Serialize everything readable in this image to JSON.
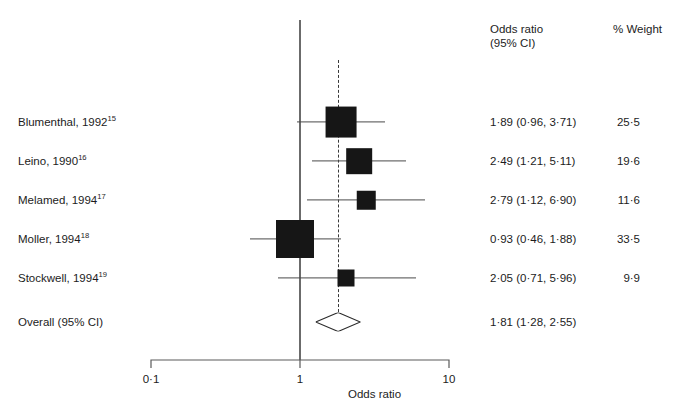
{
  "figure": {
    "headers": {
      "or_line1": "Odds ratio",
      "or_line2": "(95% CI)",
      "weight": "% Weight"
    },
    "axis": {
      "title": "Odds ratio",
      "ticks": [
        "0·1",
        "1",
        "10"
      ],
      "tick_values": [
        0.1,
        1,
        10
      ],
      "scale": "log",
      "null_value": 1
    },
    "overall": {
      "label": "Overall (95% CI)",
      "or_text": "1·81 (1·28, 2·55)",
      "weight_text": ""
    }
  },
  "chart_data": {
    "type": "forest",
    "title": "",
    "xlabel": "Odds ratio",
    "ylabel": "",
    "xscale": "log",
    "xlim": [
      0.1,
      10
    ],
    "xticks": [
      0.1,
      1,
      10
    ],
    "xticklabels": [
      "0·1",
      "1",
      "10"
    ],
    "grid": false,
    "legend": "none",
    "reference_line": 1,
    "pooled_reference_line": 1.81,
    "effect_measure": "Odds ratio",
    "ci_level": "95%",
    "columns": [
      "Study",
      "Odds ratio (95% CI)",
      "% Weight"
    ],
    "studies": [
      {
        "label": "Blumenthal, 1992",
        "ref": "15",
        "or": 1.89,
        "ci_low": 0.96,
        "ci_high": 3.71,
        "weight": 25.5,
        "or_text": "1·89 (0·96, 3·71)",
        "weight_text": "25·5"
      },
      {
        "label": "Leino, 1990",
        "ref": "16",
        "or": 2.49,
        "ci_low": 1.21,
        "ci_high": 5.11,
        "weight": 19.6,
        "or_text": "2·49 (1·21, 5·11)",
        "weight_text": "19·6"
      },
      {
        "label": "Melamed, 1994",
        "ref": "17",
        "or": 2.79,
        "ci_low": 1.12,
        "ci_high": 6.9,
        "weight": 11.6,
        "or_text": "2·79 (1·12, 6·90)",
        "weight_text": "11·6"
      },
      {
        "label": "Moller, 1994",
        "ref": "18",
        "or": 0.93,
        "ci_low": 0.46,
        "ci_high": 1.88,
        "weight": 33.5,
        "or_text": "0·93 (0·46, 1·88)",
        "weight_text": "33·5"
      },
      {
        "label": "Stockwell, 1994",
        "ref": "19",
        "or": 2.05,
        "ci_low": 0.71,
        "ci_high": 5.96,
        "weight": 9.9,
        "or_text": "2·05 (0·71, 5·96)",
        "weight_text": "9·9"
      }
    ],
    "pooled": {
      "label": "Overall (95% CI)",
      "or": 1.81,
      "ci_low": 1.28,
      "ci_high": 2.55,
      "or_text": "1·81 (1·28, 2·55)"
    }
  }
}
